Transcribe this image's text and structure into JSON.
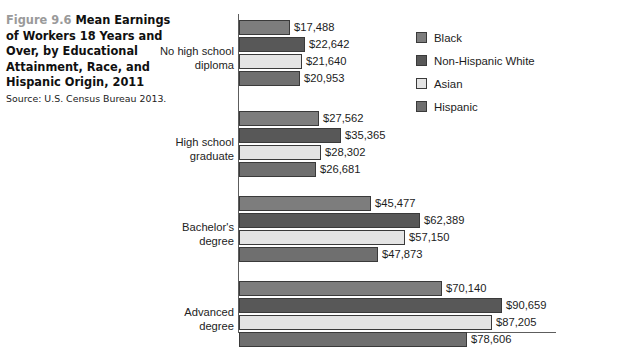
{
  "caption": {
    "figure_number": "Figure 9.6",
    "title": "Mean Earnings of Workers 18 Years and Over, by Educational Attainment, Race, and Hispanic Origin, 2011",
    "source": "Source: U.S. Census Bureau 2013."
  },
  "legend": {
    "position": "right",
    "items": [
      {
        "label": "Black",
        "color": "#7d7d7d"
      },
      {
        "label": "Non-Hispanic White",
        "color": "#585858"
      },
      {
        "label": "Asian",
        "color": "#e4e4e4"
      },
      {
        "label": "Hispanic",
        "color": "#6f6f6f"
      }
    ]
  },
  "chart_data": {
    "type": "bar",
    "orientation": "horizontal",
    "title": "Mean Earnings of Workers 18 Years and Over, by Educational Attainment, Race, and Hispanic Origin, 2011",
    "xlabel": "",
    "ylabel": "",
    "xlim": [
      0,
      107000
    ],
    "grid": false,
    "value_prefix": "$",
    "categories": [
      "No high school\ndiploma",
      "High school\ngraduate",
      "Bachelor's\ndegree",
      "Advanced\ndegree"
    ],
    "series": [
      {
        "name": "Black",
        "color": "#7d7d7d",
        "values": [
          17488,
          27562,
          45477,
          70140
        ],
        "labels": [
          "$17,488",
          "$27,562",
          "$45,477",
          "$70,140"
        ]
      },
      {
        "name": "Non-Hispanic White",
        "color": "#585858",
        "values": [
          22642,
          35365,
          62389,
          90659
        ],
        "labels": [
          "$22,642",
          "$35,365",
          "$62,389",
          "$90,659"
        ]
      },
      {
        "name": "Asian",
        "color": "#e4e4e4",
        "values": [
          21640,
          28302,
          57150,
          87205
        ],
        "labels": [
          "$21,640",
          "$28,302",
          "$57,150",
          "$87,205"
        ]
      },
      {
        "name": "Hispanic",
        "color": "#6f6f6f",
        "values": [
          20953,
          26681,
          47873,
          78606
        ],
        "labels": [
          "$20,953",
          "$26,681",
          "$47,873",
          "$78,606"
        ]
      }
    ]
  }
}
